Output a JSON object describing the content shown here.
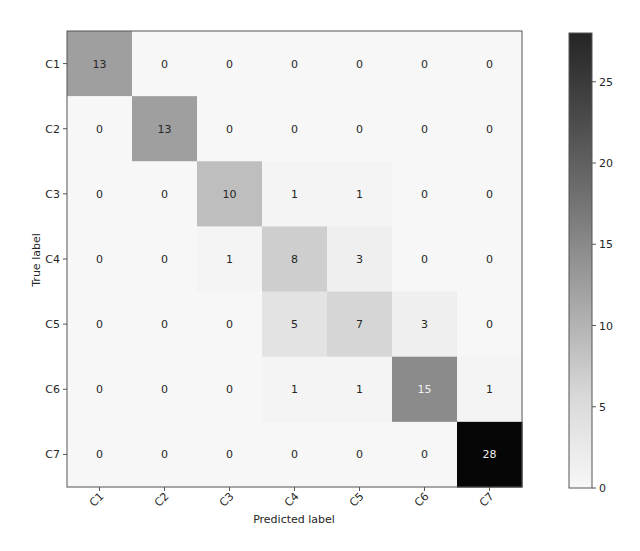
{
  "chart_data": {
    "type": "heatmap",
    "title": "",
    "xlabel": "Predicted label",
    "ylabel": "True label",
    "x_categories": [
      "C1",
      "C2",
      "C3",
      "C4",
      "C5",
      "C6",
      "C7"
    ],
    "y_categories": [
      "C1",
      "C2",
      "C3",
      "C4",
      "C5",
      "C6",
      "C7"
    ],
    "matrix": [
      [
        13,
        0,
        0,
        0,
        0,
        0,
        0
      ],
      [
        0,
        13,
        0,
        0,
        0,
        0,
        0
      ],
      [
        0,
        0,
        10,
        1,
        1,
        0,
        0
      ],
      [
        0,
        0,
        1,
        8,
        3,
        0,
        0
      ],
      [
        0,
        0,
        0,
        5,
        7,
        3,
        0
      ],
      [
        0,
        0,
        0,
        1,
        1,
        15,
        1
      ],
      [
        0,
        0,
        0,
        0,
        0,
        0,
        28
      ]
    ],
    "colormap": "Greys",
    "colorbar": {
      "min": 0,
      "max": 28,
      "ticks": [
        0,
        5,
        10,
        15,
        20,
        25
      ]
    },
    "text_threshold": 14,
    "colors": {
      "low": "#f7f7f7",
      "high": "#252525",
      "text_dark": "#262626",
      "text_light": "#eeeeee",
      "frame": "#555555"
    },
    "grid": false,
    "legend_position": "right (colorbar)"
  }
}
